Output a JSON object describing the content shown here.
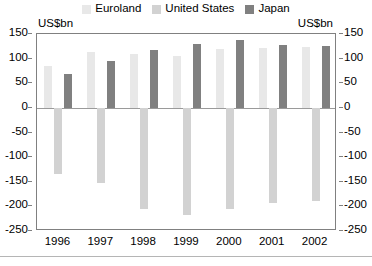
{
  "axis_captions": {
    "left": "US$bn",
    "right": "US$bn"
  },
  "legend": {
    "entries": [
      {
        "label": "Euroland",
        "color": "#e8e8e8",
        "key": "euroland"
      },
      {
        "label": "United States",
        "color": "#d2d2d2",
        "key": "united_states"
      },
      {
        "label": "Japan",
        "color": "#808080",
        "key": "japan"
      }
    ]
  },
  "chart_data": {
    "type": "bar",
    "title": "",
    "subtitle": "",
    "xlabel": "",
    "ylabel": "US$bn",
    "ylabel_right": "US$bn",
    "ylim": [
      -250,
      150
    ],
    "yticks": [
      150,
      100,
      50,
      0,
      -50,
      -100,
      -150,
      -200,
      -250
    ],
    "ytick_labels": [
      "150",
      "100",
      "50",
      "0",
      "-50",
      "-100",
      "-150",
      "-200",
      "-250"
    ],
    "grid": false,
    "zero_line": true,
    "legend_position": "top-center",
    "categories": [
      "1996",
      "1997",
      "1998",
      "1999",
      "2000",
      "2001",
      "2002"
    ],
    "series": [
      {
        "name": "Euroland",
        "color": "#e8e8e8",
        "values": [
          85,
          113,
          110,
          105,
          120,
          122,
          124
        ]
      },
      {
        "name": "United States",
        "color": "#d2d2d2",
        "values": [
          -135,
          -152,
          -205,
          -218,
          -205,
          -193,
          -190
        ]
      },
      {
        "name": "Japan",
        "color": "#808080",
        "values": [
          68,
          95,
          118,
          130,
          137,
          128,
          125
        ]
      }
    ]
  }
}
